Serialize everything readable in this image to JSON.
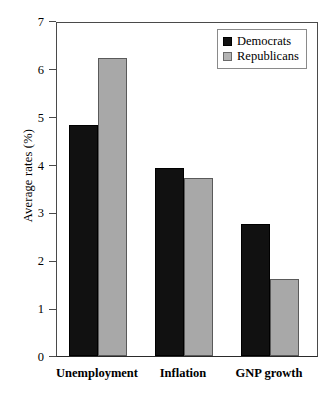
{
  "chart_data": {
    "type": "bar",
    "title": "",
    "xlabel": "",
    "ylabel": "Average rates (%)",
    "categories": [
      "Unemployment",
      "Inflation",
      "GNP growth"
    ],
    "series": [
      {
        "name": "Democrats",
        "color": "#111111",
        "values": [
          4.82,
          3.93,
          2.76
        ]
      },
      {
        "name": "Republicans",
        "color": "#a8a8a8",
        "values": [
          6.22,
          3.71,
          1.6
        ]
      }
    ],
    "ylim": [
      0,
      7
    ],
    "ytick_labels": [
      "0",
      "1",
      "2",
      "3",
      "4",
      "5",
      "6",
      "7"
    ],
    "ytick_values": [
      0,
      1,
      2,
      3,
      4,
      5,
      6,
      7
    ],
    "grid": false,
    "legend_position": "top-right"
  },
  "legend": {
    "entries": [
      {
        "label": "Democrats"
      },
      {
        "label": "Republicans"
      }
    ]
  }
}
